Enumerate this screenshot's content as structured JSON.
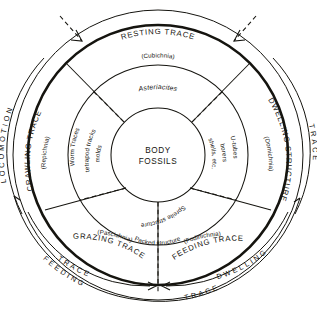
{
  "diagram": {
    "type": "concentric-ring-classification",
    "centre": {
      "line1": "BODY",
      "line2": "FOSSILS"
    },
    "rings": [
      {
        "id": "inner",
        "role": "structure-examples",
        "items": [
          {
            "label": "Worm Traces",
            "sector": "crawling"
          },
          {
            "label": "tetrapod tracks",
            "sector": "crawling"
          },
          {
            "label": "molds",
            "sector": "resting"
          },
          {
            "label": "borers",
            "sector": "dwelling"
          },
          {
            "label": "shells, etc.",
            "sector": "dwelling"
          },
          {
            "label": "U-tubes",
            "sector": "dwelling"
          },
          {
            "label": "Spreite structure",
            "sector": "feeding"
          },
          {
            "label": "Packed structure",
            "sector": "grazing"
          }
        ]
      },
      {
        "id": "middle",
        "role": "ichnogenus-and-ethologic-latin",
        "items": [
          {
            "label": "(Repichnia)",
            "sector": "crawling"
          },
          {
            "label": "Asteriacites",
            "sector": "resting",
            "italic": true
          },
          {
            "label": "(Cubichnia)",
            "sector": "resting"
          },
          {
            "label": "(Domichnia)",
            "sector": "dwelling"
          },
          {
            "label": "(Fodinichnia)",
            "sector": "feeding"
          },
          {
            "label": "(Pascichnia)",
            "sector": "grazing"
          }
        ]
      },
      {
        "id": "outer",
        "role": "behaviour-category",
        "items": [
          {
            "label": "RESTING TRACE",
            "sector": "resting"
          },
          {
            "label": "CRAWLING TRACE",
            "sector": "crawling"
          },
          {
            "label": "DWELLING STRUCTURE",
            "sector": "dwelling"
          },
          {
            "label": "FEEDING TRACE",
            "sector": "feeding"
          },
          {
            "label": "GRAZING TRACE",
            "sector": "grazing"
          }
        ]
      },
      {
        "id": "annotation-arcs",
        "role": "grouping-brackets",
        "items": [
          {
            "label": "LOCOMOTION",
            "side": "left"
          },
          {
            "label": "TRACE",
            "side": "right"
          },
          {
            "label": "FEEDING",
            "side": "bottom-left-outer"
          },
          {
            "label": "TRACE",
            "side": "bottom-left-inner"
          },
          {
            "label": "DWELLING",
            "side": "bottom-right-inner"
          },
          {
            "label": "TRACE",
            "side": "bottom-outer"
          }
        ]
      }
    ],
    "markers": [
      {
        "name": "arrow-top-left",
        "style": "dashed-with-arrowhead"
      },
      {
        "name": "arrow-top-right",
        "style": "dashed-with-arrowhead"
      },
      {
        "name": "double-arrow-bottom",
        "style": "opposed-arrowheads"
      }
    ],
    "colors": {
      "ink": "#15140f",
      "paper": "#ffffff"
    }
  }
}
